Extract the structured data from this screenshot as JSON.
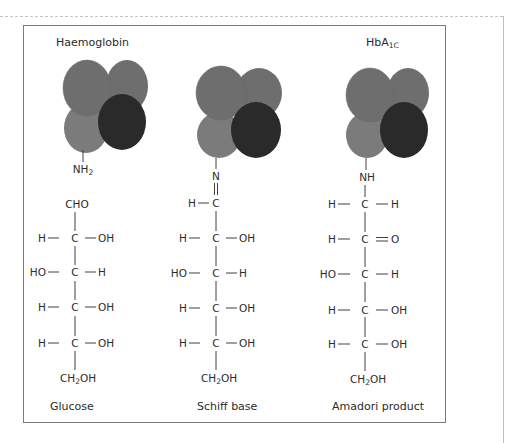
{
  "figure": {
    "colors": {
      "subunit_mid": "#6e6e6e",
      "subunit_light": "#7b7b7b",
      "subunit_dark": "#2a2a2a",
      "text": "#2b2b2b",
      "frame": "#7a7a7a"
    },
    "headers": {
      "left": "Haemoglobin",
      "right_main": "HbA",
      "right_sub": "1C"
    },
    "columns": [
      {
        "name": "glucose",
        "caption": "Glucose",
        "attachment": {
          "main": "NH",
          "sub": "2"
        },
        "top_group": "CHO",
        "rows": [
          {
            "left": "H",
            "center": "C",
            "right": "OH"
          },
          {
            "left": "HO",
            "center": "C",
            "right": "H"
          },
          {
            "left": "H",
            "center": "C",
            "right": "OH"
          },
          {
            "left": "H",
            "center": "C",
            "right": "OH"
          }
        ],
        "bottom_group": {
          "pre": "CH",
          "sub": "2",
          "post": "OH"
        }
      },
      {
        "name": "schiff-base",
        "caption": "Schiff base",
        "attachment": {
          "main": "N",
          "sub": ""
        },
        "link_bond": "=",
        "rows": [
          {
            "left": "H",
            "center": "C",
            "right": ""
          },
          {
            "left": "H",
            "center": "C",
            "right": "OH"
          },
          {
            "left": "HO",
            "center": "C",
            "right": "H"
          },
          {
            "left": "H",
            "center": "C",
            "right": "OH"
          },
          {
            "left": "H",
            "center": "C",
            "right": "OH"
          }
        ],
        "bottom_group": {
          "pre": "CH",
          "sub": "2",
          "post": "OH"
        }
      },
      {
        "name": "amadori-product",
        "caption": "Amadori product",
        "attachment": {
          "main": "NH",
          "sub": ""
        },
        "rows": [
          {
            "left": "H",
            "center": "C",
            "right": "H"
          },
          {
            "left": "H",
            "center": "C",
            "right": "O",
            "right_bond": "double"
          },
          {
            "left": "HO",
            "center": "C",
            "right": "H"
          },
          {
            "left": "H",
            "center": "C",
            "right": "OH"
          },
          {
            "left": "H",
            "center": "C",
            "right": "OH"
          }
        ],
        "bottom_group": {
          "pre": "CH",
          "sub": "2",
          "post": "OH"
        }
      }
    ]
  }
}
